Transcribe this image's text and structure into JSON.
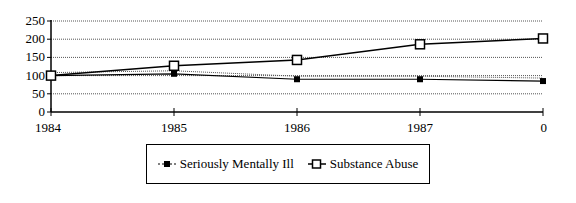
{
  "chart_data": {
    "type": "line",
    "title": "",
    "xlabel": "",
    "ylabel": "",
    "categories": [
      "1984",
      "1985",
      "1986",
      "1987",
      "0"
    ],
    "ylim": [
      0,
      250
    ],
    "yticks": [
      "0",
      "50",
      "100",
      "150",
      "200",
      "250"
    ],
    "grid": true,
    "legend_position": "bottom",
    "series": [
      {
        "name": "Seriously Mentally Ill",
        "marker": "filled-square",
        "values": [
          100,
          105,
          90,
          90,
          85
        ]
      },
      {
        "name": "Substance Abuse",
        "marker": "open-square",
        "values": [
          100,
          127,
          143,
          186,
          202
        ]
      }
    ]
  },
  "legend": {
    "items": [
      {
        "label": "Seriously Mentally Ill"
      },
      {
        "label": "Substance Abuse"
      }
    ]
  }
}
